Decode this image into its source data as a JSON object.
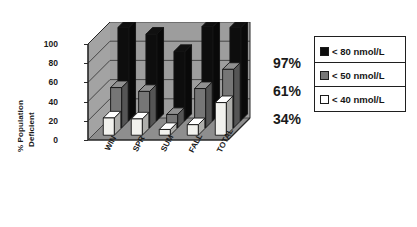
{
  "chart_data": {
    "type": "bar",
    "title": "",
    "subtitle": "",
    "xlabel": "",
    "ylabel": "% Population Deficient",
    "ylabel_line1": "% Population",
    "ylabel_line2": "Deficient",
    "categories": [
      "WIN",
      "SPR",
      "SUM",
      "FALL",
      "TOTAL"
    ],
    "ylim": [
      0,
      100
    ],
    "yticks": [
      0,
      20,
      40,
      60,
      80,
      100
    ],
    "grid": true,
    "three_d": true,
    "legend_position": "right",
    "series": [
      {
        "name": "< 80 nmol/L",
        "color": "#0d0d0d",
        "values": [
          97,
          90,
          72,
          98,
          97
        ]
      },
      {
        "name": "< 50 nmol/L",
        "color": "#767676",
        "values": [
          42,
          38,
          14,
          41,
          61
        ]
      },
      {
        "name": "< 40 nmol/L",
        "color": "#f2f2ee",
        "values": [
          18,
          17,
          6,
          11,
          34
        ]
      }
    ],
    "annotations": [
      {
        "text": "97%",
        "refers_to": "< 80 nmol/L total"
      },
      {
        "text": "61%",
        "refers_to": "< 50 nmol/L total"
      },
      {
        "text": "34%",
        "refers_to": "< 40 nmol/L total"
      }
    ]
  },
  "legend": {
    "items": [
      {
        "label": "< 80 nmol/L",
        "color": "#0d0d0d"
      },
      {
        "label": "< 50 nmol/L",
        "color": "#767676"
      },
      {
        "label": "< 40 nmol/L",
        "color": "#ffffff"
      }
    ]
  },
  "colors": {
    "background": "#ffffff",
    "wall": "#9d9d9d",
    "wall_light": "#a8a8a8",
    "floor": "#8e8e8e",
    "axis": "#262626",
    "text": "#1a1a1a"
  }
}
